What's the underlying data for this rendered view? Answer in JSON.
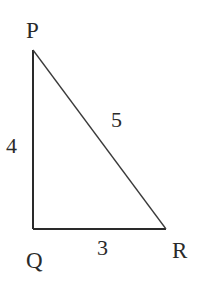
{
  "diagram": {
    "type": "right-triangle",
    "vertices": {
      "P": {
        "label": "P",
        "x": 33,
        "y": 50
      },
      "Q": {
        "label": "Q",
        "x": 33,
        "y": 229
      },
      "R": {
        "label": "R",
        "x": 166,
        "y": 229
      }
    },
    "sides": {
      "PQ": {
        "label": "4"
      },
      "PR": {
        "label": "5"
      },
      "QR": {
        "label": "3"
      }
    },
    "stroke_color": "#2a2a2a"
  }
}
